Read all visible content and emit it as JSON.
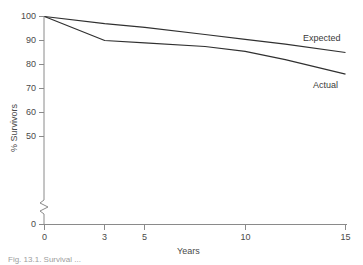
{
  "chart_data": {
    "type": "line",
    "title": "",
    "xlabel": "Years",
    "ylabel": "% Survivors",
    "xlim": [
      0,
      15
    ],
    "ylim": [
      45,
      101
    ],
    "grid": false,
    "legend_position": "inline-right-of-curves",
    "x_ticks": [
      0,
      3,
      5,
      10,
      15
    ],
    "x_tick_labels": [
      "0",
      "3",
      "5",
      "10",
      "15"
    ],
    "y_ticks": [
      0,
      50,
      60,
      70,
      80,
      90,
      100
    ],
    "y_tick_labels": [
      "0",
      "50",
      "60",
      "70",
      "80",
      "90",
      "100"
    ],
    "y_axis_break": true,
    "y_axis_break_between": [
      0,
      50
    ],
    "series": [
      {
        "name": "Expected",
        "label": "Expected",
        "color": "#303030",
        "x": [
          0,
          3,
          5,
          8,
          10,
          12,
          15
        ],
        "values": [
          100,
          97,
          95.5,
          92.5,
          90.5,
          88.5,
          85
        ]
      },
      {
        "name": "Actual",
        "label": "Actual",
        "color": "#303030",
        "x": [
          0,
          3,
          5,
          8,
          10,
          12,
          15
        ],
        "values": [
          100,
          90,
          89,
          87.5,
          85.5,
          82,
          76
        ]
      }
    ],
    "annotations": [
      {
        "text": "Expected",
        "x_value": 14.0,
        "y_value": 89.5
      },
      {
        "text": "Actual",
        "x_value": 14.6,
        "y_value": 70.5
      }
    ]
  },
  "axis": {
    "y_title": "% Survivors",
    "x_title": "Years"
  },
  "caption": {
    "text": "Fig. 13.1. Survival ..."
  },
  "colors": {
    "line": "#303030",
    "axis": "#7a7a7a",
    "text": "#4a4a4a",
    "background": "#ffffff"
  }
}
